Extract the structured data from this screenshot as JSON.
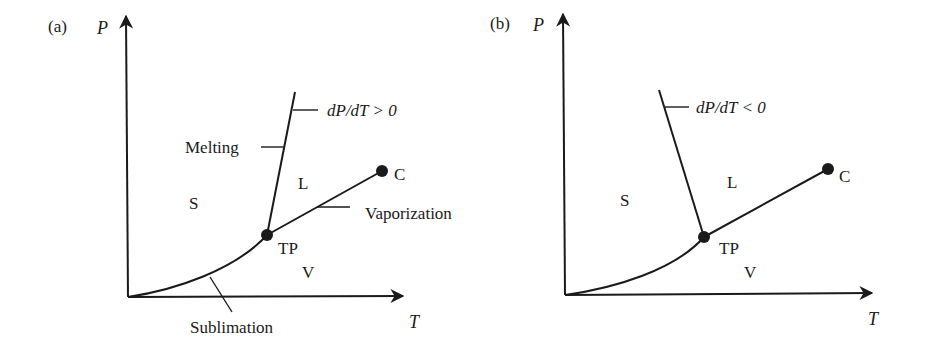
{
  "figure": {
    "panels": [
      {
        "id": "a",
        "panel_label": "(a)",
        "y_axis_label": "P",
        "x_axis_label": "T",
        "regions": {
          "solid": "S",
          "liquid": "L",
          "vapor": "V"
        },
        "points": {
          "triple_point": "TP",
          "critical_point": "C"
        },
        "curves": {
          "melting": "Melting",
          "vaporization": "Vaporization",
          "sublimation": "Sublimation"
        },
        "slope_annotation": "dP/dT > 0"
      },
      {
        "id": "b",
        "panel_label": "(b)",
        "y_axis_label": "P",
        "x_axis_label": "T",
        "regions": {
          "solid": "S",
          "liquid": "L",
          "vapor": "V"
        },
        "points": {
          "triple_point": "TP",
          "critical_point": "C"
        },
        "slope_annotation": "dP/dT < 0"
      }
    ],
    "colors": {
      "ink": "#1a1a1a",
      "background": "#ffffff"
    }
  }
}
